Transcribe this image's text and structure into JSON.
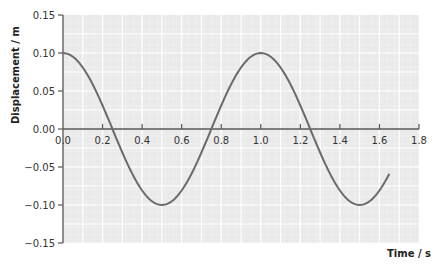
{
  "chart_data": {
    "type": "line",
    "title": "",
    "xlabel": "Time/s",
    "ylabel": "Displacement/m",
    "xlim": [
      0,
      1.8
    ],
    "ylim": [
      -0.15,
      0.15
    ],
    "x_ticks": [
      "0.0",
      "0.2",
      "0.4",
      "0.6",
      "0.8",
      "1.0",
      "1.2",
      "1.4",
      "1.6",
      "1.8"
    ],
    "y_ticks": [
      "0.15",
      "0.10",
      "0.05",
      "0.00",
      "-0.05",
      "-0.10",
      "-0.15"
    ],
    "grid": true,
    "legend": null,
    "series": [
      {
        "name": "displacement",
        "function": "0.10*cos(2*pi*t/1.0)",
        "x": [
          0.0,
          0.05,
          0.1,
          0.15,
          0.2,
          0.25,
          0.3,
          0.35,
          0.4,
          0.45,
          0.5,
          0.55,
          0.6,
          0.65,
          0.7,
          0.75,
          0.8,
          0.85,
          0.9,
          0.95,
          1.0,
          1.05,
          1.1,
          1.15,
          1.2,
          1.25,
          1.3,
          1.35,
          1.4,
          1.45,
          1.5,
          1.55,
          1.6,
          1.65
        ],
        "values": [
          0.1,
          0.095,
          0.081,
          0.059,
          0.031,
          0.0,
          -0.031,
          -0.059,
          -0.081,
          -0.095,
          -0.1,
          -0.095,
          -0.081,
          -0.059,
          -0.031,
          0.0,
          0.031,
          0.059,
          0.081,
          0.095,
          0.1,
          0.095,
          0.081,
          0.059,
          0.031,
          0.0,
          -0.031,
          -0.059,
          -0.081,
          -0.095,
          -0.1,
          -0.095,
          -0.081,
          -0.059
        ]
      }
    ],
    "amplitude": 0.1,
    "period": 1.0
  },
  "axes": {
    "ylabel": "Displacement / m",
    "xlabel": "Time / s"
  },
  "colors": {
    "curve": "#6b6b6b",
    "axis": "#555555",
    "grid_bg": "#e9e9e9"
  }
}
